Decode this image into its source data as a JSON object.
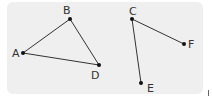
{
  "diagram": {
    "background": "#efefef",
    "points": [
      {
        "label": "A",
        "x": 23,
        "y": 53
      },
      {
        "label": "B",
        "x": 70,
        "y": 19
      },
      {
        "label": "D",
        "x": 99,
        "y": 65
      },
      {
        "label": "C",
        "x": 132,
        "y": 19
      },
      {
        "label": "F",
        "x": 184,
        "y": 44
      },
      {
        "label": "E",
        "x": 141,
        "y": 83
      }
    ],
    "edges": [
      [
        "A",
        "B"
      ],
      [
        "B",
        "D"
      ],
      [
        "A",
        "D"
      ],
      [
        "C",
        "F"
      ],
      [
        "C",
        "E"
      ]
    ],
    "labels": {
      "A": "A",
      "B": "B",
      "C": "C",
      "D": "D",
      "E": "E",
      "F": "F"
    }
  }
}
